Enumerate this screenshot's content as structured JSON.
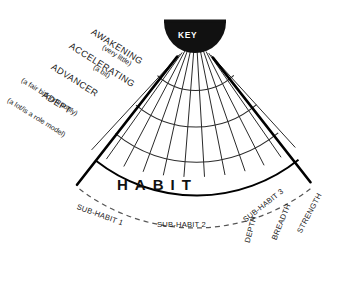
{
  "diagram": {
    "title": "HABIT",
    "hub": {
      "label": "KEY",
      "shape": "semicircle",
      "fill": "#111111",
      "text_color": "#ffffff"
    },
    "center_label": "HABIT",
    "levels": [
      {
        "name": "AWAKENING",
        "note": "(very little)"
      },
      {
        "name": "ACCELERATING",
        "note": "(a bit)"
      },
      {
        "name": "ADVANCER",
        "note": "(a fair bit/commonly)"
      },
      {
        "name": "ADEPT",
        "note": "(a lot/is a role model)"
      }
    ],
    "sub_habits": [
      {
        "label": "SUB-HABIT 1"
      },
      {
        "label": "SUB-HABIT 2"
      },
      {
        "label": "SUB-HABIT 3"
      }
    ],
    "axes": [
      {
        "label": "DEPTH"
      },
      {
        "label": "BREADTH"
      },
      {
        "label": "STRENGTH"
      }
    ],
    "colors": {
      "ink": "#111111",
      "grid": "#2a2a2a",
      "edge": "#000000",
      "background": "#ffffff"
    }
  }
}
